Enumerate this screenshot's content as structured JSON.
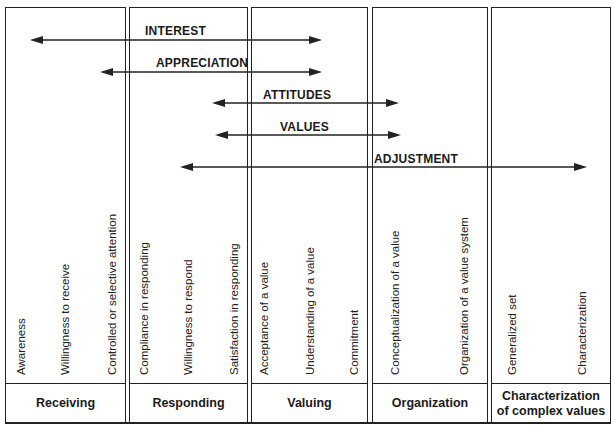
{
  "columns": [
    {
      "header": "Receiving",
      "subcategories": [
        "Awareness",
        "Willingness to receive",
        "Controlled or selective attention"
      ]
    },
    {
      "header": "Responding",
      "subcategories": [
        "Compliance in responding",
        "Willingness to respond",
        "Satisfaction in responding"
      ]
    },
    {
      "header": "Valuing",
      "subcategories": [
        "Acceptance of a value",
        "Understanding of a value",
        "Commitment"
      ]
    },
    {
      "header": "Organization",
      "subcategories": [
        "Conceptualization of a value",
        "Organization of a value system"
      ]
    },
    {
      "header_line1": "Characterization",
      "header_line2": "of complex values",
      "subcategories": [
        "Generalized set",
        "Characterization"
      ]
    }
  ],
  "arrows": [
    {
      "label": "INTEREST",
      "x1": 30,
      "x2": 322,
      "y": 40
    },
    {
      "label": "APPRECIATION",
      "x1": 100,
      "x2": 322,
      "y": 72
    },
    {
      "label": "ATTITUDES",
      "x1": 212,
      "x2": 399,
      "y": 103
    },
    {
      "label": "VALUES",
      "x1": 215,
      "x2": 401,
      "y": 135
    },
    {
      "label": "ADJUSTMENT",
      "x1": 180,
      "x2": 587,
      "y": 167
    }
  ],
  "colors": {
    "line": "#222222",
    "background": "#ffffff",
    "text": "#1a1a1a"
  }
}
